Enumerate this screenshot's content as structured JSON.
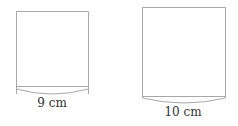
{
  "diagram": {
    "type": "cylinders-side-view",
    "shapes": [
      {
        "id": "cylinder-small",
        "label": "9 cm",
        "x": 16,
        "y": 11,
        "width": 72,
        "height": 75,
        "arc_depth": 8,
        "label_x": 52,
        "label_y": 107
      },
      {
        "id": "cylinder-large",
        "label": "10 cm",
        "x": 142,
        "y": 7,
        "width": 83,
        "height": 89,
        "arc_depth": 7,
        "label_x": 183,
        "label_y": 116
      }
    ],
    "colors": {
      "stroke": "#a8a8a8",
      "text": "#333333",
      "background": "#ffffff"
    }
  }
}
